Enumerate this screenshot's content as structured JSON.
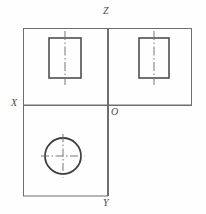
{
  "drawing": {
    "title": "Orthographic projection: three-view layout",
    "background_color": "#fefefe",
    "line_color": "#6e6e6e",
    "outline_color": "#555555",
    "centerline_color": "#777777",
    "label_color": "#4a4a4a",
    "axes": {
      "vertical_x": 108,
      "horizontal_y": 105,
      "vertical_top": 28,
      "vertical_bottom": 196,
      "horizontal_left": 23,
      "horizontal_right": 192
    },
    "labels": [
      {
        "id": "z",
        "text": "Z",
        "meaning": "z-axis-label",
        "x": 103,
        "y": 6
      },
      {
        "id": "x",
        "text": "X",
        "meaning": "x-axis-label",
        "x": 11,
        "y": 98
      },
      {
        "id": "o",
        "text": "O",
        "meaning": "origin-label",
        "x": 111,
        "y": 107
      },
      {
        "id": "y",
        "text": "Y",
        "meaning": "y-axis-label",
        "x": 103,
        "y": 198
      }
    ],
    "panels": [
      {
        "id": "front-view",
        "name": "front-view-panel",
        "x": 23,
        "y": 28,
        "width": 85,
        "height": 77
      },
      {
        "id": "side-view",
        "name": "side-view-panel",
        "x": 108,
        "y": 28,
        "width": 84,
        "height": 77
      },
      {
        "id": "top-view",
        "name": "top-view-panel",
        "x": 23,
        "y": 105,
        "width": 85,
        "height": 91
      }
    ],
    "shapes": {
      "front_rectangle": {
        "name": "front-view-rectangle",
        "x": 49,
        "y": 38,
        "width": 32,
        "height": 40,
        "centerline_axis": "vertical",
        "centerline_x": 65,
        "centerline_top": 31,
        "centerline_bottom": 85
      },
      "side_rectangle": {
        "name": "side-view-rectangle",
        "x": 139,
        "y": 38,
        "width": 30,
        "height": 40,
        "centerline_axis": "vertical",
        "centerline_x": 154,
        "centerline_top": 31,
        "centerline_bottom": 85
      },
      "top_circle": {
        "name": "top-view-circle",
        "cx": 63,
        "cy": 156,
        "r": 18,
        "centerline_h_left": 41,
        "centerline_h_right": 85,
        "centerline_v_top": 134,
        "centerline_v_bottom": 178
      }
    },
    "line_styles": {
      "frame": "thin solid",
      "outline": "thick solid",
      "centerline": "dash-dot"
    }
  }
}
